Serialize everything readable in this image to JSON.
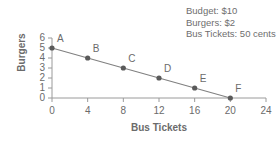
{
  "chart_data": {
    "type": "line",
    "title": "",
    "xlabel": "Bus Tickets",
    "ylabel": "Burgers",
    "xlim": [
      0,
      24
    ],
    "ylim": [
      0,
      6
    ],
    "xticks": [
      "0",
      "4",
      "8",
      "12",
      "16",
      "20",
      "24"
    ],
    "yticks": [
      "0",
      "1",
      "2",
      "3",
      "4",
      "5",
      "6"
    ],
    "grid": false,
    "legend": "none",
    "line_color": "#808080",
    "marker_color": "#5a5a5a",
    "axis_color": "#9a9a9a",
    "text_color": "#6b6b6b",
    "x": [
      0,
      4,
      8,
      12,
      16,
      20
    ],
    "values": [
      5,
      4,
      3,
      2,
      1,
      0
    ],
    "point_labels": [
      "A",
      "B",
      "C",
      "D",
      "E",
      "F"
    ],
    "annotations": [
      "Budget: $10",
      "Burgers: $2",
      "Bus Tickets: 50 cents"
    ]
  }
}
